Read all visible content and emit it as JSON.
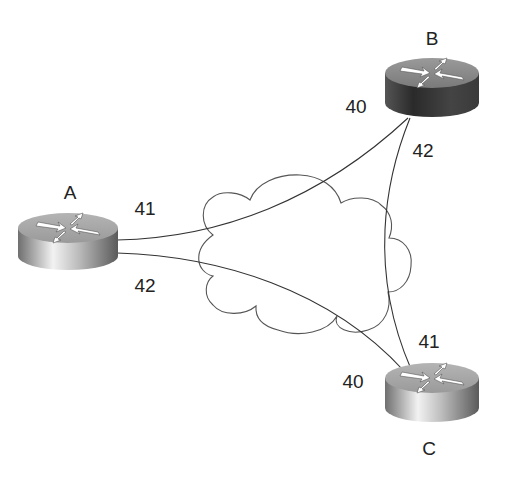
{
  "diagram": {
    "type": "network-topology",
    "cloud": {
      "name": "wan-cloud"
    },
    "routers": [
      {
        "id": "A",
        "label": "A",
        "cx": 68,
        "cy": 228,
        "top_color": "#a7a7a7",
        "body_light": "#e9e9e9",
        "body_dark": "#6a6a6a"
      },
      {
        "id": "B",
        "label": "B",
        "cx": 432,
        "cy": 73,
        "top_color": "#8a8a8a",
        "body_light": "#6a6a6a",
        "body_dark": "#2b2b2b"
      },
      {
        "id": "C",
        "label": "C",
        "cx": 432,
        "cy": 378,
        "top_color": "#a7a7a7",
        "body_light": "#e9e9e9",
        "body_dark": "#6a6a6a"
      }
    ],
    "links": [
      {
        "from": "A",
        "to": "B",
        "from_label": "41",
        "to_label": "40"
      },
      {
        "from": "A",
        "to": "C",
        "from_label": "42",
        "to_label": "40"
      },
      {
        "from": "B",
        "to": "C",
        "from_label": "42",
        "to_label": "41"
      }
    ],
    "labels": {
      "router_a": "A",
      "router_b": "B",
      "router_c": "C",
      "a_to_b_port": "41",
      "a_to_c_port": "42",
      "b_to_a_port": "40",
      "b_to_c_port": "42",
      "c_to_b_port": "41",
      "c_to_a_port": "40"
    },
    "colors": {
      "line": "#333333",
      "text": "#222222"
    }
  }
}
